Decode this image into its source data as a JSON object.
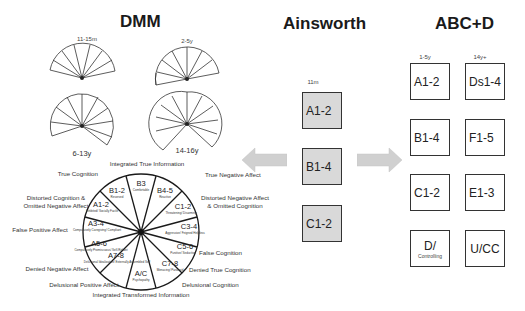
{
  "titles": {
    "dmm": "DMM",
    "ainsworth": "Ainsworth",
    "abcd": "ABC+D"
  },
  "dmm": {
    "fans": [
      {
        "age": "11-15m",
        "segments": [
          "A1",
          "A1-2",
          "B1-2",
          "B3",
          "B4-5",
          "C1-2",
          "C1"
        ]
      },
      {
        "age": "2-5y",
        "segments": [
          "A3-4",
          "A1-2",
          "B1-2",
          "B3",
          "B4-5",
          "C1-2",
          "C3-4"
        ]
      },
      {
        "age": "6-13y",
        "segments": [
          "A3-4",
          "A1-2",
          "B1-2",
          "B3",
          "B4-5",
          "C1-2",
          "C3-4",
          "C5-6"
        ]
      },
      {
        "age": "14-16y",
        "segments": [
          "A5-6",
          "A3-4",
          "A1-2",
          "B1-2",
          "B3",
          "B4-5",
          "C1-2",
          "C3-4",
          "C5-6"
        ]
      }
    ],
    "circle": {
      "segments": [
        {
          "code": "B3",
          "desc": "Comfortable"
        },
        {
          "code": "B4-5",
          "desc": "Reactive"
        },
        {
          "code": "C1-2",
          "desc": "Threatening/ Disarming"
        },
        {
          "code": "C3-4",
          "desc": "Aggressive/ Feigned Helpless"
        },
        {
          "code": "C5-6",
          "desc": "Punitive/ Seductive"
        },
        {
          "code": "C7-8",
          "desc": "Menacing/ Paranoid"
        },
        {
          "code": "A/C",
          "desc": "Psychopathy"
        },
        {
          "code": "A7-8",
          "desc": "Delusional Idealization/ Externally Assembled Self"
        },
        {
          "code": "A5-6",
          "desc": "Compulsively Promiscuous/ Self-Reliant"
        },
        {
          "code": "A3-4",
          "desc": "Compulsively Caregiving/ Compliant"
        },
        {
          "code": "A1-2",
          "desc": "Inhibited/ Socially Facile"
        },
        {
          "code": "B1-2",
          "desc": "Reserved"
        }
      ],
      "labels": {
        "top": "Integrated True Information",
        "true_cognition": "True Cognition",
        "true_negative_affect": "True Negative Affect",
        "distorted_cognition": "Distorted Cognition &",
        "distorted_cognition_2": "Omitted Negative Affect",
        "distorted_negative": "Distorted Negative Affect",
        "distorted_negative_2": "& Omitted Cognition",
        "false_positive_affect": "False Positive Affect",
        "false_cognition": "False Cognition",
        "denied_negative_affect": "Denied Negative Affect",
        "denied_true_cognition": "Denied True Cognition",
        "delusional_positive_affect": "Delusional Positive Affect",
        "delusional_cognition": "Delusional Cognition",
        "bottom": "Integrated Transformed Information"
      }
    }
  },
  "ainsworth": {
    "age": "11m",
    "boxes": [
      "A1-2",
      "B1-4",
      "C1-2"
    ]
  },
  "abcd": {
    "ages": [
      "1-5y",
      "14y+"
    ],
    "left": [
      "A1-2",
      "B1-4",
      "C1-2",
      "D/"
    ],
    "left_sub": "Controlling",
    "right": [
      "Ds1-4",
      "F1-5",
      "E1-3",
      "U/CC"
    ]
  },
  "colors": {
    "box_fill": "#d9d9d9",
    "arrow": "#d0d0d0",
    "line": "#333333"
  }
}
